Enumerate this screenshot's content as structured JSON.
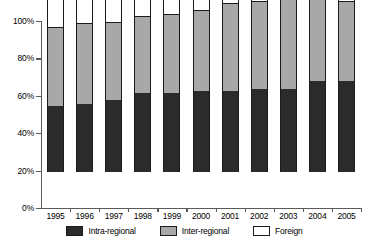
{
  "chart_data": {
    "type": "bar",
    "subtype": "stacked-percentage",
    "title": "",
    "subtitle": "",
    "xlabel": "",
    "ylabel": "",
    "categories": [
      "1995",
      "1996",
      "1997",
      "1998",
      "1999",
      "2000",
      "2001",
      "2002",
      "2003",
      "2004",
      "2005"
    ],
    "series": [
      {
        "name": "Intra-regional",
        "color": "#2b2b2b",
        "values": [
          36,
          37,
          39,
          43,
          43,
          44,
          44,
          45,
          45,
          49,
          49
        ]
      },
      {
        "name": "Inter-regional",
        "color": "#a8a8a8",
        "values": [
          42,
          43,
          42,
          41,
          42,
          43,
          47,
          47,
          48,
          45,
          43
        ]
      },
      {
        "name": "Foreign",
        "color": "#ffffff",
        "values": [
          22,
          20,
          19,
          16,
          15,
          13,
          9,
          8,
          7,
          6,
          8
        ]
      }
    ],
    "ylim": [
      0,
      100
    ],
    "y_ticks": [
      {
        "value": 0,
        "label": "0%"
      },
      {
        "value": 20,
        "label": "20%"
      },
      {
        "value": 40,
        "label": "40%"
      },
      {
        "value": 60,
        "label": "60%"
      },
      {
        "value": 80,
        "label": "80%"
      },
      {
        "value": 100,
        "label": "100%"
      }
    ],
    "grid": false,
    "legend_position": "bottom",
    "legend": [
      {
        "label": "Intra-regional",
        "color": "#2b2b2b"
      },
      {
        "label": "Inter-regional",
        "color": "#a8a8a8"
      },
      {
        "label": "Foreign",
        "color": "#ffffff"
      }
    ]
  }
}
